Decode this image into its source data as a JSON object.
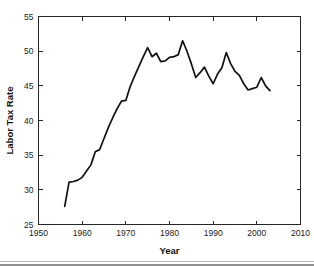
{
  "figure": {
    "background_color": "#ffffff",
    "line_color": "#111111",
    "axis_color": "#262626",
    "divider_color": "#b8b8b8"
  },
  "axis_titles": {
    "x": "Year",
    "y": "Labor Tax Rate"
  },
  "chart_data": {
    "type": "line",
    "title": "",
    "xlabel": "Year",
    "ylabel": "Labor Tax Rate",
    "xlim": [
      1950,
      2010
    ],
    "ylim": [
      25,
      55
    ],
    "xticks": [
      1950,
      1960,
      1970,
      1980,
      1990,
      2000,
      2010
    ],
    "xticklabels": [
      "1950",
      "1960",
      "1970",
      "1980",
      "1990",
      "2000",
      "2010"
    ],
    "yticks": [
      25,
      30,
      35,
      40,
      45,
      50,
      55
    ],
    "yticklabels": [
      "25",
      "30",
      "35",
      "40",
      "45",
      "50",
      "55"
    ],
    "grid": false,
    "legend": null,
    "series": [
      {
        "name": "Labor Tax Rate",
        "x": [
          1956,
          1957,
          1958,
          1959,
          1960,
          1961,
          1962,
          1963,
          1964,
          1965,
          1966,
          1967,
          1968,
          1969,
          1970,
          1971,
          1972,
          1973,
          1974,
          1975,
          1976,
          1977,
          1978,
          1979,
          1980,
          1981,
          1982,
          1983,
          1984,
          1985,
          1986,
          1987,
          1988,
          1989,
          1990,
          1991,
          1992,
          1993,
          1994,
          1995,
          1996,
          1997,
          1998,
          1999,
          2000,
          2001,
          2002,
          2003
        ],
        "values": [
          27.6,
          31.1,
          31.2,
          31.4,
          31.8,
          32.7,
          33.6,
          35.5,
          35.8,
          37.4,
          39.0,
          40.4,
          41.7,
          42.8,
          42.9,
          44.9,
          46.4,
          47.8,
          49.2,
          50.5,
          49.2,
          49.7,
          48.5,
          48.6,
          49.1,
          49.2,
          49.5,
          51.5,
          50.0,
          48.2,
          46.2,
          46.9,
          47.7,
          46.4,
          45.3,
          46.7,
          47.6,
          49.8,
          48.2,
          47.1,
          46.5,
          45.3,
          44.4,
          44.6,
          44.8,
          46.2,
          45.0,
          44.3
        ]
      }
    ]
  }
}
